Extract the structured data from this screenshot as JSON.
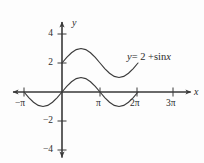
{
  "figure": {
    "background_color": "#fdfdfd",
    "line_color": "#3a3a3a",
    "text_color": "#2b2b2b"
  },
  "labels": {
    "x_axis_name": "x",
    "y_axis_name": "y",
    "curve_label_lhs": "y",
    "curve_label_eq": "= 2 +",
    "curve_label_fn": "sin",
    "curve_label_var": "x",
    "curve_label_full": "y = 2 + sin x"
  },
  "x_ticks": [
    {
      "label": "−π",
      "value": -3.14159,
      "px": 24
    },
    {
      "label": "π",
      "value": 3.14159,
      "px": 100
    },
    {
      "label": "2π",
      "value": 6.28319,
      "px": 137
    },
    {
      "label": "3π",
      "value": 9.42478,
      "px": 173
    }
  ],
  "y_ticks": [
    {
      "label": "4",
      "value": 4,
      "px": 34
    },
    {
      "label": "2",
      "value": 2,
      "px": 63
    },
    {
      "label": "−2",
      "value": -2,
      "px": 121
    },
    {
      "label": "−4",
      "value": -4,
      "px": 150
    }
  ],
  "chart_data": {
    "type": "line",
    "title": "",
    "subtitle": "",
    "xlabel": "x",
    "ylabel": "y",
    "grid": false,
    "legend": "none",
    "annotations": [
      {
        "text": "y = 2 + sin x",
        "x": 7.6,
        "y": 2.6,
        "target_series": "y = 2 + sin x"
      }
    ],
    "xlim": [
      -4.2,
      10.6
    ],
    "ylim": [
      -5.1,
      5.1
    ],
    "xtick_labels": [
      "−π",
      "π",
      "2π",
      "3π"
    ],
    "xtick_values": [
      -3.14159,
      3.14159,
      6.28319,
      9.42478
    ],
    "ytick_labels": [
      "4",
      "2",
      "−2",
      "−4"
    ],
    "ytick_values": [
      4,
      2,
      -2,
      -4
    ],
    "series": [
      {
        "name": "y = 2 + sin x",
        "equation": "y = 2 + sin x",
        "domain": [
          0,
          6.28319
        ],
        "amplitude": 1,
        "vertical_shift": 2,
        "x": [
          0,
          0.3927,
          0.7854,
          1.1781,
          1.5708,
          1.9635,
          2.3562,
          2.7489,
          3.1416,
          3.5343,
          3.927,
          4.3197,
          4.7124,
          5.1051,
          5.4978,
          5.8905,
          6.2832
        ],
        "values": [
          2,
          2.3827,
          2.7071,
          2.9239,
          3,
          2.9239,
          2.7071,
          2.3827,
          2,
          1.6173,
          1.2929,
          1.0761,
          1,
          1.0761,
          1.2929,
          1.6173,
          2
        ]
      },
      {
        "name": "y = sin x",
        "equation": "y = sin x",
        "domain": [
          -3.14159,
          6.28319
        ],
        "amplitude": 1,
        "vertical_shift": 0,
        "x": [
          -3.1416,
          -2.7489,
          -2.3562,
          -1.9635,
          -1.5708,
          -1.1781,
          -0.7854,
          -0.3927,
          0,
          0.3927,
          0.7854,
          1.1781,
          1.5708,
          1.9635,
          2.3562,
          2.7489,
          3.1416,
          3.5343,
          3.927,
          4.3197,
          4.7124,
          5.1051,
          5.4978,
          5.8905,
          6.2832
        ],
        "values": [
          0,
          -0.3827,
          -0.7071,
          -0.9239,
          -1,
          -0.9239,
          -0.7071,
          -0.3827,
          0,
          0.3827,
          0.7071,
          0.9239,
          1,
          0.9239,
          0.7071,
          0.3827,
          0,
          -0.3827,
          -0.7071,
          -0.9239,
          -1,
          -0.9239,
          -0.7071,
          -0.3827,
          0
        ]
      }
    ]
  }
}
